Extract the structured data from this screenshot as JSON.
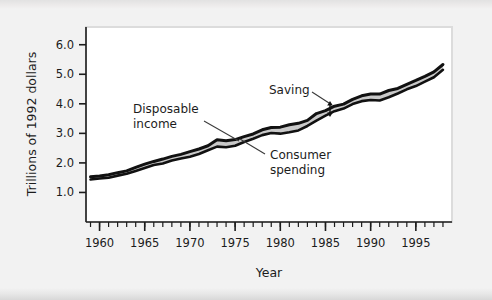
{
  "figure": {
    "background_color": "#f2f2f2",
    "plot_background_color": "#ffffff",
    "plot_border_color": "#d9d9d9"
  },
  "chart_data": {
    "type": "area",
    "title": "",
    "subtitle": "",
    "xlabel": "Year",
    "ylabel": "Trillions of 1992 dollars",
    "xlim": [
      1958.5,
      1999.0
    ],
    "ylim": [
      0.0,
      6.6
    ],
    "grid": false,
    "legend_position": "inline-annotations",
    "x_major_ticks": [
      1960,
      1965,
      1970,
      1975,
      1980,
      1985,
      1990,
      1995
    ],
    "x_major_tick_labels": [
      "1960",
      "1965",
      "1970",
      "1975",
      "1980",
      "1985",
      "1990",
      "1995"
    ],
    "x_minor_tick_step": 1,
    "y_major_ticks": [
      1.0,
      2.0,
      3.0,
      4.0,
      5.0,
      6.0
    ],
    "y_major_tick_labels": [
      "1.0",
      "2.0",
      "3.0",
      "4.0",
      "5.0",
      "6.0"
    ],
    "x": [
      1959,
      1960,
      1961,
      1962,
      1963,
      1964,
      1965,
      1966,
      1967,
      1968,
      1969,
      1970,
      1971,
      1972,
      1973,
      1974,
      1975,
      1976,
      1977,
      1978,
      1979,
      1980,
      1981,
      1982,
      1983,
      1984,
      1985,
      1986,
      1987,
      1988,
      1989,
      1990,
      1991,
      1992,
      1993,
      1994,
      1995,
      1996,
      1997,
      1998
    ],
    "series": [
      {
        "name": "Disposable income",
        "color": "#111111",
        "values": [
          1.53,
          1.56,
          1.6,
          1.67,
          1.73,
          1.85,
          1.96,
          2.05,
          2.13,
          2.22,
          2.29,
          2.38,
          2.47,
          2.58,
          2.78,
          2.75,
          2.79,
          2.89,
          2.98,
          3.12,
          3.2,
          3.21,
          3.29,
          3.34,
          3.44,
          3.67,
          3.77,
          3.92,
          3.99,
          4.15,
          4.27,
          4.33,
          4.33,
          4.45,
          4.52,
          4.66,
          4.79,
          4.93,
          5.08,
          5.33
        ]
      },
      {
        "name": "Consumer spending",
        "color": "#111111",
        "values": [
          1.44,
          1.47,
          1.5,
          1.57,
          1.63,
          1.73,
          1.83,
          1.93,
          1.98,
          2.08,
          2.15,
          2.21,
          2.3,
          2.43,
          2.55,
          2.53,
          2.58,
          2.71,
          2.82,
          2.94,
          3.01,
          2.99,
          3.04,
          3.1,
          3.25,
          3.43,
          3.6,
          3.75,
          3.84,
          3.99,
          4.09,
          4.13,
          4.11,
          4.22,
          4.35,
          4.49,
          4.6,
          4.75,
          4.9,
          5.15
        ]
      }
    ],
    "band": {
      "name": "Saving",
      "description": "Shaded area between disposable income and consumer spending",
      "color": "#c9c9c9"
    },
    "annotations": [
      {
        "name": "disposable-income",
        "text_line1": "Disposable",
        "text_line2": "income",
        "text_x": 133,
        "text_y": 113,
        "leader_from_x": 204,
        "leader_from_y": 121,
        "leader_to_x": 239,
        "leader_to_y": 141
      },
      {
        "name": "saving",
        "text_line1": "Saving",
        "text_line2": "",
        "text_x": 269,
        "text_y": 94,
        "leader_from_x": 312,
        "leader_from_y": 92,
        "leader_to_x": 329,
        "leader_to_y": 103
      },
      {
        "name": "consumer-spending",
        "text_line1": "Consumer",
        "text_line2": "spending",
        "text_x": 270,
        "text_y": 155,
        "leader_from_x": 265,
        "leader_from_y": 151,
        "leader_to_x": 240,
        "leader_to_y": 138
      }
    ],
    "saving_gap_marker": {
      "name": "saving-gap-arrow",
      "x": 330,
      "y_top": 103,
      "y_bottom": 115
    }
  }
}
